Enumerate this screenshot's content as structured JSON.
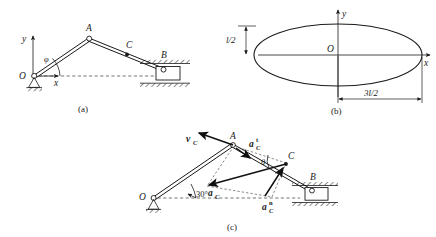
{
  "figure": {
    "background_color": "#ffffff",
    "ink_color": "#1a1a1a"
  },
  "panels": [
    {
      "id": "a",
      "caption": "(a)",
      "description": "Crank OA and connecting rod AB with slider at B in a horizontal guide",
      "points": [
        {
          "name": "O",
          "label": "O",
          "role": "fixed-pivot"
        },
        {
          "name": "A",
          "label": "A",
          "role": "pin-joint"
        },
        {
          "name": "C",
          "label": "C",
          "role": "midpoint-marker"
        },
        {
          "name": "B",
          "label": "B",
          "role": "slider"
        }
      ],
      "axes": [
        {
          "name": "y-axis",
          "label": "y",
          "direction": "up"
        },
        {
          "name": "x-axis",
          "label": "x",
          "direction": "right"
        }
      ],
      "angles": [
        {
          "name": "phi",
          "label": "φ",
          "between": "OA and x-axis"
        }
      ]
    },
    {
      "id": "b",
      "caption": "(b)",
      "description": "Elliptical path traced by point C, centered at O",
      "points": [
        {
          "name": "O",
          "label": "O",
          "role": "ellipse-center"
        }
      ],
      "axes": [
        {
          "name": "y-axis",
          "label": "y",
          "direction": "up"
        },
        {
          "name": "x-axis",
          "label": "x",
          "direction": "right"
        }
      ],
      "dimensions": [
        {
          "name": "semi-minor-axis",
          "label": "l/2",
          "axis": "vertical"
        },
        {
          "name": "semi-major-axis",
          "label": "3l/2",
          "axis": "horizontal"
        }
      ]
    },
    {
      "id": "c",
      "caption": "(c)",
      "description": "Velocity and acceleration vectors at point C of the mechanism",
      "points": [
        {
          "name": "O",
          "label": "O",
          "role": "fixed-pivot"
        },
        {
          "name": "A",
          "label": "A",
          "role": "pin-joint"
        },
        {
          "name": "C",
          "label": "C",
          "role": "point-of-interest"
        },
        {
          "name": "B",
          "label": "B",
          "role": "slider"
        }
      ],
      "angles": [
        {
          "name": "thirty-degrees",
          "label": "30°",
          "between": "OA and horizontal"
        },
        {
          "name": "theta",
          "label": "θ",
          "between": "rod and dashed reference"
        }
      ],
      "vectors": [
        {
          "name": "velocity-c",
          "base": "v",
          "subscript": "C",
          "superscript": "",
          "label": "v_C",
          "kind": "velocity"
        },
        {
          "name": "acceleration-c-tangential",
          "base": "a",
          "subscript": "C",
          "superscript": "t",
          "label": "a_C^t",
          "kind": "tangential-acceleration"
        },
        {
          "name": "acceleration-c-total",
          "base": "a",
          "subscript": "C",
          "superscript": "",
          "label": "a_C",
          "kind": "total-acceleration"
        },
        {
          "name": "acceleration-c-normal",
          "base": "a",
          "subscript": "C",
          "superscript": "n",
          "label": "a_C^n",
          "kind": "normal-acceleration"
        }
      ]
    }
  ]
}
